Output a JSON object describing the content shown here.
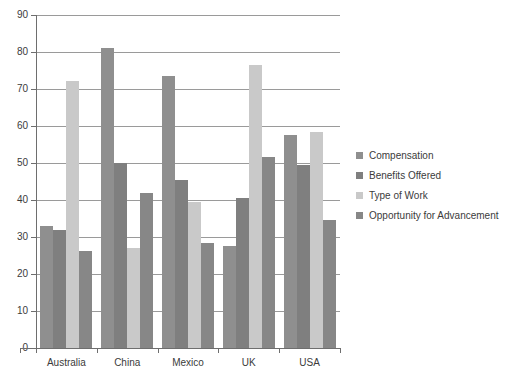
{
  "chart_data": {
    "type": "bar",
    "title": "",
    "xlabel": "",
    "ylabel": "",
    "ylim": [
      0,
      90
    ],
    "ytick_step": 10,
    "yticks": [
      0,
      10,
      20,
      30,
      40,
      50,
      60,
      70,
      80,
      90
    ],
    "grid": true,
    "legend_position": "right",
    "categories": [
      "Australia",
      "China",
      "Mexico",
      "UK",
      "USA"
    ],
    "series": [
      {
        "name": "Compensation",
        "color": "#8f8f8f",
        "values": [
          33.0,
          81.0,
          73.5,
          27.5,
          57.5
        ]
      },
      {
        "name": "Benefits Offered",
        "color": "#7f7f7f",
        "values": [
          32.0,
          50.0,
          45.5,
          40.5,
          49.5
        ]
      },
      {
        "name": "Type of Work",
        "color": "#c9c9c9",
        "values": [
          72.3,
          27.0,
          39.5,
          76.5,
          58.5
        ]
      },
      {
        "name": "Opportunity for Advancement",
        "color": "#878787",
        "values": [
          26.3,
          42.0,
          28.5,
          51.5,
          34.5
        ]
      }
    ]
  },
  "axis": {
    "tick_labels": [
      "90",
      "80",
      "70",
      "60",
      "50",
      "40",
      "30",
      "20",
      "10",
      "0"
    ]
  },
  "colors": {
    "gridline": "#9a9a9a",
    "axis": "#6e6e6e",
    "text": "#3b3b3b",
    "background": "#ffffff"
  }
}
